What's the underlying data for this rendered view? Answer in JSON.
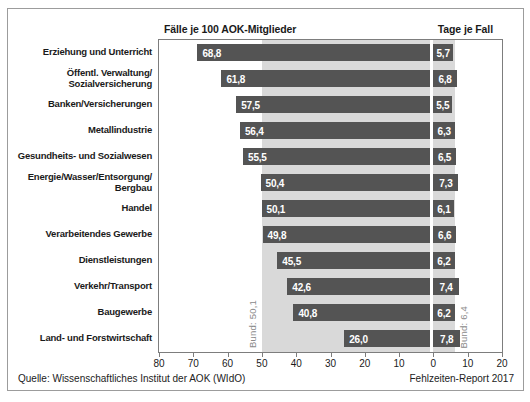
{
  "figure": {
    "title_left": "Fälle je 100 AOK-Mitglieder",
    "title_right": "Tage je Fall",
    "footer_left": "Quelle: Wissenschaftliches Institut der AOK (WIdO)",
    "footer_right": "Fehlzeiten-Report 2017"
  },
  "chart_data": {
    "type": "bar",
    "orientation": "horizontal-diverging",
    "categories": [
      "Erziehung und Unterricht",
      "Öffentl. Verwaltung/\nSozialversicherung",
      "Banken/Versicherungen",
      "Metallindustrie",
      "Gesundheits- und Sozialwesen",
      "Energie/Wasser/Entsorgung/\nBergbau",
      "Handel",
      "Verarbeitendes Gewerbe",
      "Dienstleistungen",
      "Verkehr/Transport",
      "Baugewerbe",
      "Land- und Forstwirtschaft"
    ],
    "series": [
      {
        "name": "Fälle je 100 AOK-Mitglieder",
        "axis": "left",
        "range": [
          80,
          0
        ],
        "values": [
          68.8,
          61.8,
          57.5,
          56.4,
          55.5,
          50.4,
          50.1,
          49.8,
          45.5,
          42.6,
          40.8,
          26.0
        ]
      },
      {
        "name": "Tage je Fall",
        "axis": "right",
        "range": [
          0,
          20
        ],
        "values": [
          5.7,
          6.8,
          5.5,
          6.3,
          6.5,
          7.3,
          6.1,
          6.6,
          6.2,
          7.4,
          6.2,
          7.8
        ]
      }
    ],
    "bund_left": {
      "label": "Bund: 50,1",
      "value": 50.1
    },
    "bund_right": {
      "label": "Bund: 6,4",
      "value": 6.4
    },
    "axis_ticks_left": [
      80,
      70,
      60,
      50,
      40,
      30,
      20,
      10,
      0
    ],
    "axis_ticks_right": [
      10,
      20
    ],
    "legend_position": "none",
    "grid": false,
    "colors": {
      "bar": "#545454",
      "band": "#d9d9d9",
      "value_text": "#ffffff",
      "bund_text": "#8a8a8a"
    }
  }
}
